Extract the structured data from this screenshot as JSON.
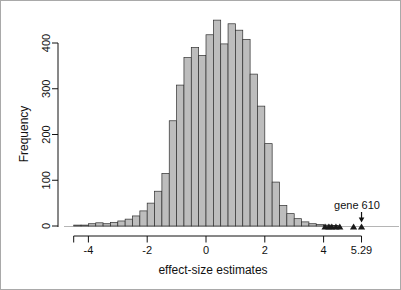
{
  "figure": {
    "background": "#ffffff",
    "frame_color": "#a9a9a9"
  },
  "chart_data": {
    "type": "bar",
    "subtype": "histogram",
    "title": "",
    "xlabel": "effect-size estimates",
    "ylabel": "Frequency",
    "bin_start": -4.5,
    "bin_width": 0.25,
    "frequencies": [
      2,
      2,
      5,
      7,
      5,
      8,
      11,
      15,
      22,
      33,
      50,
      76,
      115,
      230,
      308,
      368,
      390,
      373,
      418,
      450,
      398,
      442,
      428,
      408,
      332,
      262,
      180,
      96,
      45,
      27,
      16,
      9,
      5,
      3,
      2,
      1
    ],
    "x_axis_range": [
      -4.5,
      5.29
    ],
    "x_ticks": [
      {
        "value": -4.5,
        "label": ""
      },
      {
        "value": -4,
        "label": "-4"
      },
      {
        "value": -2,
        "label": "-2"
      },
      {
        "value": 0,
        "label": "0"
      },
      {
        "value": 2,
        "label": "2"
      },
      {
        "value": 4,
        "label": "4"
      },
      {
        "value": 5.29,
        "label": "5.29"
      }
    ],
    "y_ticks": [
      {
        "value": 0,
        "label": "0"
      },
      {
        "value": 100,
        "label": "100"
      },
      {
        "value": 200,
        "label": "200"
      },
      {
        "value": 300,
        "label": "300"
      },
      {
        "value": 400,
        "label": "400"
      }
    ],
    "ylim": [
      0,
      460
    ],
    "grid": "off",
    "legend": "none",
    "bar_fill": "#bdbdbd",
    "bar_stroke": "#2e2e2e",
    "axis_color": "#111111",
    "baseline_color": "#b5b5b5",
    "outlier_points": {
      "shape": "triangle-up",
      "color": "#1a1a1a",
      "x": [
        4.05,
        4.18,
        4.28,
        4.42,
        4.55,
        5.02
      ]
    },
    "annotation": {
      "text": "gene 610",
      "x": 5.29,
      "arrow": "down"
    }
  }
}
